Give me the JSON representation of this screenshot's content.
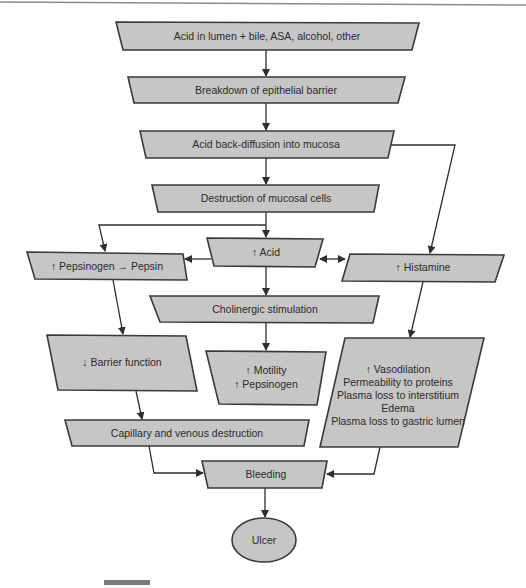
{
  "diagram": {
    "type": "flowchart",
    "colors": {
      "node_fill": "#c6c6c6",
      "node_stroke": "#3a3a3a",
      "edge": "#2e2e2e",
      "background": "#ffffff"
    },
    "nodes": {
      "acid_lumen": {
        "label": "Acid in lumen + bile, ASA, alcohol, other"
      },
      "breakdown": {
        "label": "Breakdown of epithelial barrier"
      },
      "back_diffusion": {
        "label": "Acid back-diffusion into mucosa"
      },
      "destruction": {
        "label": "Destruction of mucosal cells"
      },
      "acid_up": {
        "label": "↑ Acid"
      },
      "pepsinogen_pepsin": {
        "label": "↑ Pepsinogen → Pepsin"
      },
      "histamine": {
        "label": "↑ Histamine"
      },
      "cholinergic": {
        "label": "Cholinergic stimulation"
      },
      "barrier_down": {
        "label": "↓ Barrier function"
      },
      "motility": {
        "lines": [
          "↑ Motility",
          "↑ Pepsinogen"
        ]
      },
      "vasodilation": {
        "lines": [
          "↑ Vasodilation",
          "Permeability to proteins",
          "Plasma loss to interstitium",
          "Edema",
          "Plasma loss to gastric lumen"
        ]
      },
      "capillary": {
        "label": "Capillary and venous destruction"
      },
      "bleeding": {
        "label": "Bleeding"
      },
      "ulcer": {
        "label": "Ulcer"
      }
    },
    "edges": [
      [
        "acid_lumen",
        "breakdown"
      ],
      [
        "breakdown",
        "back_diffusion"
      ],
      [
        "back_diffusion",
        "destruction"
      ],
      [
        "back_diffusion",
        "histamine"
      ],
      [
        "destruction",
        "acid_up"
      ],
      [
        "destruction",
        "pepsinogen_pepsin"
      ],
      [
        "acid_up",
        "pepsinogen_pepsin"
      ],
      [
        "acid_up",
        "histamine",
        "bidirectional"
      ],
      [
        "acid_up",
        "cholinergic"
      ],
      [
        "pepsinogen_pepsin",
        "barrier_down"
      ],
      [
        "histamine",
        "vasodilation"
      ],
      [
        "cholinergic",
        "motility"
      ],
      [
        "barrier_down",
        "capillary"
      ],
      [
        "capillary",
        "bleeding"
      ],
      [
        "vasodilation",
        "bleeding"
      ],
      [
        "bleeding",
        "ulcer"
      ]
    ]
  }
}
